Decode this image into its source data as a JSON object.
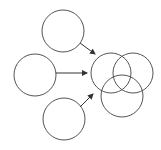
{
  "diagram": {
    "colors": {
      "stroke": "#555555",
      "arrow": "#333333",
      "background": "#ffffff"
    },
    "source_circles": [
      {
        "id": "top",
        "cx": 63,
        "cy": 31,
        "r": 21
      },
      {
        "id": "left",
        "cx": 35,
        "cy": 75,
        "r": 21
      },
      {
        "id": "bottom",
        "cx": 64,
        "cy": 119,
        "r": 21
      }
    ],
    "venn_circles": [
      {
        "id": "venn-left",
        "cx": 111,
        "cy": 73,
        "r": 20
      },
      {
        "id": "venn-right",
        "cx": 133,
        "cy": 73,
        "r": 20
      },
      {
        "id": "venn-bottom",
        "cx": 122,
        "cy": 96,
        "r": 21
      }
    ],
    "arrows": [
      {
        "from": "top",
        "x1": 80,
        "y1": 43,
        "x2": 95,
        "y2": 54
      },
      {
        "from": "left",
        "x1": 56,
        "y1": 73,
        "x2": 87,
        "y2": 73
      },
      {
        "from": "bottom",
        "x1": 80,
        "y1": 107,
        "x2": 93,
        "y2": 94
      }
    ]
  }
}
